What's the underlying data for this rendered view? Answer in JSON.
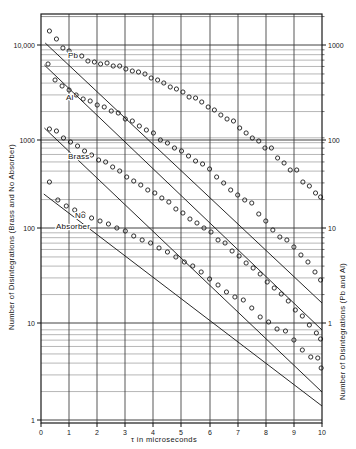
{
  "chart_data": {
    "type": "line",
    "title": "",
    "xlabel": "τ  in microseconds",
    "ylabel_left": "Number of Disintegrations (Brass and No Absorber)",
    "ylabel_right": "Number of Disintegrations (Pb and Al)",
    "scale": "semilog-y",
    "xlim": [
      0,
      10
    ],
    "xticks": [
      "0",
      "1",
      "2",
      "3",
      "4",
      "5",
      "6",
      "7",
      "8",
      "9",
      "10"
    ],
    "ylim_left": [
      1,
      30000
    ],
    "yticks_left": [
      "1",
      "10",
      "100",
      "1000",
      "10,000"
    ],
    "ylim_right": [
      0.1,
      3000
    ],
    "yticks_right": [
      "1",
      "10",
      "100",
      "1000"
    ],
    "grid": "log-minor-and-major",
    "annotations": [
      "Pb",
      "Al",
      "Brass",
      "No Absorber"
    ],
    "series": [
      {
        "name": "Pb",
        "label": "Pb",
        "axis": "right",
        "fit_start": {
          "x": 0.15,
          "y_px": 43
        },
        "fit_end": {
          "x": 10.0,
          "y_px": 303
        },
        "points": [
          {
            "x": 0.3,
            "y_px": 31
          },
          {
            "x": 0.55,
            "y_px": 39
          },
          {
            "x": 0.78,
            "y_px": 48
          },
          {
            "x": 1.0,
            "y_px": 51
          },
          {
            "x": 1.22,
            "y_px": 55
          },
          {
            "x": 1.45,
            "y_px": 56
          },
          {
            "x": 1.67,
            "y_px": 61
          },
          {
            "x": 1.9,
            "y_px": 62
          },
          {
            "x": 2.12,
            "y_px": 64
          },
          {
            "x": 2.35,
            "y_px": 63
          },
          {
            "x": 2.57,
            "y_px": 66
          },
          {
            "x": 2.8,
            "y_px": 66
          },
          {
            "x": 3.02,
            "y_px": 69
          },
          {
            "x": 3.25,
            "y_px": 71
          },
          {
            "x": 3.47,
            "y_px": 72
          },
          {
            "x": 3.7,
            "y_px": 74
          },
          {
            "x": 3.92,
            "y_px": 78
          },
          {
            "x": 4.15,
            "y_px": 80
          },
          {
            "x": 4.37,
            "y_px": 83
          },
          {
            "x": 4.6,
            "y_px": 87
          },
          {
            "x": 4.82,
            "y_px": 89
          },
          {
            "x": 5.05,
            "y_px": 92
          },
          {
            "x": 5.27,
            "y_px": 97
          },
          {
            "x": 5.5,
            "y_px": 98
          },
          {
            "x": 5.72,
            "y_px": 102
          },
          {
            "x": 5.95,
            "y_px": 107
          },
          {
            "x": 6.17,
            "y_px": 110
          },
          {
            "x": 6.4,
            "y_px": 115
          },
          {
            "x": 6.62,
            "y_px": 119
          },
          {
            "x": 6.85,
            "y_px": 121
          },
          {
            "x": 7.07,
            "y_px": 128
          },
          {
            "x": 7.3,
            "y_px": 133
          },
          {
            "x": 7.52,
            "y_px": 138
          },
          {
            "x": 7.75,
            "y_px": 141
          },
          {
            "x": 7.97,
            "y_px": 148
          },
          {
            "x": 8.2,
            "y_px": 148
          },
          {
            "x": 8.42,
            "y_px": 158
          },
          {
            "x": 8.65,
            "y_px": 163
          },
          {
            "x": 8.87,
            "y_px": 170
          },
          {
            "x": 9.1,
            "y_px": 170
          },
          {
            "x": 9.32,
            "y_px": 182
          },
          {
            "x": 9.55,
            "y_px": 186
          },
          {
            "x": 9.77,
            "y_px": 193
          },
          {
            "x": 9.95,
            "y_px": 197
          }
        ]
      },
      {
        "name": "Al",
        "label": "Al",
        "axis": "right",
        "fit_start": {
          "x": 0.12,
          "y_px": 65
        },
        "fit_end": {
          "x": 10.0,
          "y_px": 330
        },
        "points": [
          {
            "x": 0.25,
            "y_px": 64
          },
          {
            "x": 0.5,
            "y_px": 80
          },
          {
            "x": 0.75,
            "y_px": 86
          },
          {
            "x": 1.0,
            "y_px": 90
          },
          {
            "x": 1.25,
            "y_px": 95
          },
          {
            "x": 1.5,
            "y_px": 99
          },
          {
            "x": 1.75,
            "y_px": 101
          },
          {
            "x": 2.0,
            "y_px": 105
          },
          {
            "x": 2.25,
            "y_px": 107
          },
          {
            "x": 2.5,
            "y_px": 111
          },
          {
            "x": 2.75,
            "y_px": 113
          },
          {
            "x": 3.0,
            "y_px": 119
          },
          {
            "x": 3.25,
            "y_px": 121
          },
          {
            "x": 3.5,
            "y_px": 126
          },
          {
            "x": 3.75,
            "y_px": 130
          },
          {
            "x": 4.0,
            "y_px": 133
          },
          {
            "x": 4.25,
            "y_px": 140
          },
          {
            "x": 4.5,
            "y_px": 143
          },
          {
            "x": 4.75,
            "y_px": 148
          },
          {
            "x": 5.0,
            "y_px": 151
          },
          {
            "x": 5.25,
            "y_px": 156
          },
          {
            "x": 5.5,
            "y_px": 161
          },
          {
            "x": 5.75,
            "y_px": 164
          },
          {
            "x": 6.0,
            "y_px": 169
          },
          {
            "x": 6.25,
            "y_px": 177
          },
          {
            "x": 6.5,
            "y_px": 183
          },
          {
            "x": 6.75,
            "y_px": 190
          },
          {
            "x": 7.0,
            "y_px": 195
          },
          {
            "x": 7.25,
            "y_px": 200
          },
          {
            "x": 7.5,
            "y_px": 203
          },
          {
            "x": 7.75,
            "y_px": 214
          },
          {
            "x": 8.0,
            "y_px": 221
          },
          {
            "x": 8.25,
            "y_px": 230
          },
          {
            "x": 8.5,
            "y_px": 237
          },
          {
            "x": 8.75,
            "y_px": 240
          },
          {
            "x": 9.0,
            "y_px": 247
          },
          {
            "x": 9.25,
            "y_px": 255
          },
          {
            "x": 9.5,
            "y_px": 262
          },
          {
            "x": 9.75,
            "y_px": 272
          },
          {
            "x": 9.95,
            "y_px": 280
          }
        ]
      },
      {
        "name": "Brass",
        "label": "Brass",
        "axis": "left",
        "fit_start": {
          "x": 0.12,
          "y_px": 128
        },
        "fit_end": {
          "x": 10.0,
          "y_px": 392
        },
        "points": [
          {
            "x": 0.3,
            "y_px": 129
          },
          {
            "x": 0.55,
            "y_px": 131
          },
          {
            "x": 0.8,
            "y_px": 138
          },
          {
            "x": 1.05,
            "y_px": 142
          },
          {
            "x": 1.3,
            "y_px": 146
          },
          {
            "x": 1.55,
            "y_px": 151
          },
          {
            "x": 1.8,
            "y_px": 155
          },
          {
            "x": 2.05,
            "y_px": 160
          },
          {
            "x": 2.3,
            "y_px": 162
          },
          {
            "x": 2.55,
            "y_px": 167
          },
          {
            "x": 2.8,
            "y_px": 171
          },
          {
            "x": 3.05,
            "y_px": 177
          },
          {
            "x": 3.3,
            "y_px": 181
          },
          {
            "x": 3.55,
            "y_px": 185
          },
          {
            "x": 3.8,
            "y_px": 190
          },
          {
            "x": 4.05,
            "y_px": 193
          },
          {
            "x": 4.3,
            "y_px": 198
          },
          {
            "x": 4.55,
            "y_px": 202
          },
          {
            "x": 4.8,
            "y_px": 209
          },
          {
            "x": 5.05,
            "y_px": 213
          },
          {
            "x": 5.3,
            "y_px": 219
          },
          {
            "x": 5.55,
            "y_px": 223
          },
          {
            "x": 5.8,
            "y_px": 228
          },
          {
            "x": 6.05,
            "y_px": 232
          },
          {
            "x": 6.3,
            "y_px": 240
          },
          {
            "x": 6.55,
            "y_px": 243
          },
          {
            "x": 6.8,
            "y_px": 251
          },
          {
            "x": 7.05,
            "y_px": 256
          },
          {
            "x": 7.3,
            "y_px": 263
          },
          {
            "x": 7.55,
            "y_px": 268
          },
          {
            "x": 7.8,
            "y_px": 274
          },
          {
            "x": 8.05,
            "y_px": 282
          },
          {
            "x": 8.3,
            "y_px": 288
          },
          {
            "x": 8.55,
            "y_px": 294
          },
          {
            "x": 8.8,
            "y_px": 301
          },
          {
            "x": 9.05,
            "y_px": 310
          },
          {
            "x": 9.3,
            "y_px": 316
          },
          {
            "x": 9.55,
            "y_px": 325
          },
          {
            "x": 9.8,
            "y_px": 333
          },
          {
            "x": 9.95,
            "y_px": 339
          }
        ]
      },
      {
        "name": "No Absorber",
        "label": "No Absorber",
        "axis": "left",
        "fit_start": {
          "x": 0.1,
          "y_px": 194
        },
        "fit_end": {
          "x": 10.0,
          "y_px": 406
        },
        "points": [
          {
            "x": 0.3,
            "y_px": 182
          },
          {
            "x": 0.6,
            "y_px": 200
          },
          {
            "x": 0.9,
            "y_px": 206
          },
          {
            "x": 1.2,
            "y_px": 210
          },
          {
            "x": 1.5,
            "y_px": 214
          },
          {
            "x": 1.8,
            "y_px": 218
          },
          {
            "x": 2.1,
            "y_px": 221
          },
          {
            "x": 2.4,
            "y_px": 224
          },
          {
            "x": 2.7,
            "y_px": 228
          },
          {
            "x": 3.0,
            "y_px": 231
          },
          {
            "x": 3.3,
            "y_px": 236
          },
          {
            "x": 3.6,
            "y_px": 240
          },
          {
            "x": 3.9,
            "y_px": 243
          },
          {
            "x": 4.2,
            "y_px": 248
          },
          {
            "x": 4.5,
            "y_px": 252
          },
          {
            "x": 4.8,
            "y_px": 257
          },
          {
            "x": 5.1,
            "y_px": 262
          },
          {
            "x": 5.4,
            "y_px": 266
          },
          {
            "x": 5.7,
            "y_px": 272
          },
          {
            "x": 6.0,
            "y_px": 279
          },
          {
            "x": 6.3,
            "y_px": 285
          },
          {
            "x": 6.6,
            "y_px": 292
          },
          {
            "x": 6.9,
            "y_px": 297
          },
          {
            "x": 7.2,
            "y_px": 300
          },
          {
            "x": 7.5,
            "y_px": 308
          },
          {
            "x": 7.8,
            "y_px": 317
          },
          {
            "x": 8.1,
            "y_px": 322
          },
          {
            "x": 8.4,
            "y_px": 329
          },
          {
            "x": 8.7,
            "y_px": 331
          },
          {
            "x": 9.0,
            "y_px": 340
          },
          {
            "x": 9.3,
            "y_px": 350
          },
          {
            "x": 9.6,
            "y_px": 357
          },
          {
            "x": 9.85,
            "y_px": 358
          },
          {
            "x": 9.97,
            "y_px": 368
          }
        ]
      }
    ]
  },
  "axes": {
    "left_title": "Number of Disintegrations (Brass and No Absorber)",
    "right_title": "Number of Disintegrations (Pb and Al)",
    "x_title": "τ  in microseconds",
    "left_ticks": [
      {
        "label": "10,000",
        "y": 45
      },
      {
        "label": "1000",
        "y": 140
      },
      {
        "label": "100",
        "y": 228
      },
      {
        "label": "10",
        "y": 323
      },
      {
        "label": "1",
        "y": 420
      }
    ],
    "right_ticks": [
      {
        "label": "1000",
        "y": 45
      },
      {
        "label": "100",
        "y": 140
      },
      {
        "label": "10",
        "y": 228
      },
      {
        "label": "1",
        "y": 323
      }
    ],
    "x_ticks": [
      {
        "label": "0",
        "x": 41
      },
      {
        "label": "1",
        "x": 69
      },
      {
        "label": "2",
        "x": 97
      },
      {
        "label": "3",
        "x": 125
      },
      {
        "label": "4",
        "x": 153
      },
      {
        "label": "5",
        "x": 181
      },
      {
        "label": "6",
        "x": 210
      },
      {
        "label": "7",
        "x": 238
      },
      {
        "label": "8",
        "x": 266
      },
      {
        "label": "9",
        "x": 294
      },
      {
        "label": "10",
        "x": 322
      }
    ]
  },
  "curve_labels": [
    {
      "text": "Pb",
      "x": 68,
      "y": 58
    },
    {
      "text": "Al",
      "x": 66,
      "y": 100
    },
    {
      "text": "Brass",
      "x": 68,
      "y": 159
    },
    {
      "text": "No",
      "x": 75,
      "y": 218
    },
    {
      "text": "Absorber",
      "x": 56,
      "y": 229
    }
  ],
  "colors": {
    "ink": "#1a1a1a",
    "grid": "#5a5a5a",
    "grid_minor": "#8a8a8a",
    "background": "#ffffff"
  }
}
